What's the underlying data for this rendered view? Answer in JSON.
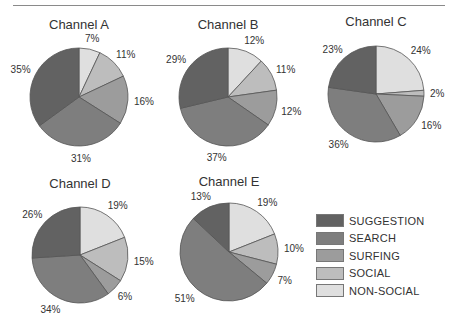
{
  "categories": [
    "NON-SOCIAL",
    "SOCIAL",
    "SURFING",
    "SEARCH",
    "SUGGESTION"
  ],
  "colors": {
    "SUGGESTION": "#626262",
    "SEARCH": "#7e7e7e",
    "SURFING": "#9c9c9c",
    "SOCIAL": "#bdbdbd",
    "NON-SOCIAL": "#dfdfdf"
  },
  "legend": {
    "items": [
      {
        "label": "SUGGESTION",
        "color": "#626262"
      },
      {
        "label": "SEARCH",
        "color": "#7e7e7e"
      },
      {
        "label": "SURFING",
        "color": "#9c9c9c"
      },
      {
        "label": "SOCIAL",
        "color": "#bdbdbd"
      },
      {
        "label": "NON-SOCIAL",
        "color": "#dfdfdf"
      }
    ]
  },
  "chart_data": [
    {
      "type": "pie",
      "title": "Channel A",
      "categories": [
        "NON-SOCIAL",
        "SOCIAL",
        "SURFING",
        "SEARCH",
        "SUGGESTION"
      ],
      "values": [
        7,
        11,
        16,
        31,
        35
      ],
      "labels": [
        "7%",
        "11%",
        "16%",
        "31%",
        "35%"
      ]
    },
    {
      "type": "pie",
      "title": "Channel B",
      "categories": [
        "NON-SOCIAL",
        "SOCIAL",
        "SURFING",
        "SEARCH",
        "SUGGESTION"
      ],
      "values": [
        12,
        11,
        12,
        37,
        29
      ],
      "labels": [
        "12%",
        "11%",
        "12%",
        "37%",
        "29%"
      ]
    },
    {
      "type": "pie",
      "title": "Channel C",
      "categories": [
        "NON-SOCIAL",
        "SOCIAL",
        "SURFING",
        "SEARCH",
        "SUGGESTION"
      ],
      "values": [
        24,
        2,
        16,
        36,
        23
      ],
      "labels": [
        "24%",
        "2%",
        "16%",
        "36%",
        "23%"
      ]
    },
    {
      "type": "pie",
      "title": "Channel D",
      "categories": [
        "NON-SOCIAL",
        "SOCIAL",
        "SURFING",
        "SEARCH",
        "SUGGESTION"
      ],
      "values": [
        19,
        15,
        6,
        34,
        26
      ],
      "labels": [
        "19%",
        "15%",
        "6%",
        "34%",
        "26%"
      ]
    },
    {
      "type": "pie",
      "title": "Channel E",
      "categories": [
        "NON-SOCIAL",
        "SOCIAL",
        "SURFING",
        "SEARCH",
        "SUGGESTION"
      ],
      "values": [
        19,
        10,
        7,
        51,
        13
      ],
      "labels": [
        "19%",
        "10%",
        "7%",
        "51%",
        "13%"
      ]
    }
  ]
}
